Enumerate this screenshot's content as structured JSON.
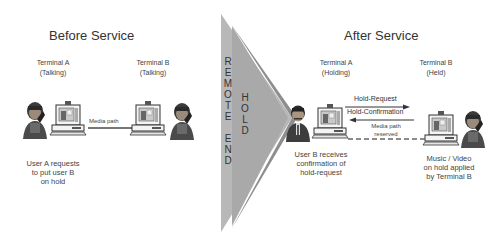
{
  "before": {
    "title": "Before Service",
    "terminal_a": {
      "name": "Terminal A",
      "state": "(Talking)"
    },
    "terminal_b": {
      "name": "Terminal B",
      "state": "(Talking)"
    },
    "media_path_label": "Media path",
    "note_lines": [
      "User A requests",
      "to put user B",
      "on hold"
    ]
  },
  "divider": {
    "outer_text": [
      "R",
      "E",
      "M",
      "O",
      "T",
      "E",
      "",
      "E",
      "N",
      "D"
    ],
    "inner_text": [
      "H",
      "O",
      "L",
      "D"
    ],
    "colors": {
      "outer": "#b8b8b8",
      "inner": "#8e8e8e"
    }
  },
  "after": {
    "title": "After Service",
    "terminal_a": {
      "name": "Terminal A",
      "state": "(Holding)"
    },
    "terminal_b": {
      "name": "Terminal B",
      "state": "(Held)"
    },
    "messages": {
      "request": "Hold-Request",
      "confirmation": "Hold-Confirmation",
      "media_path_lines": [
        "Media path",
        "reserved"
      ]
    },
    "note_a_lines": [
      "User B receives",
      "confirmation of",
      "hold-request"
    ],
    "note_b_lines": [
      "Music / Video",
      "on hold applied",
      "by Terminal B"
    ]
  }
}
